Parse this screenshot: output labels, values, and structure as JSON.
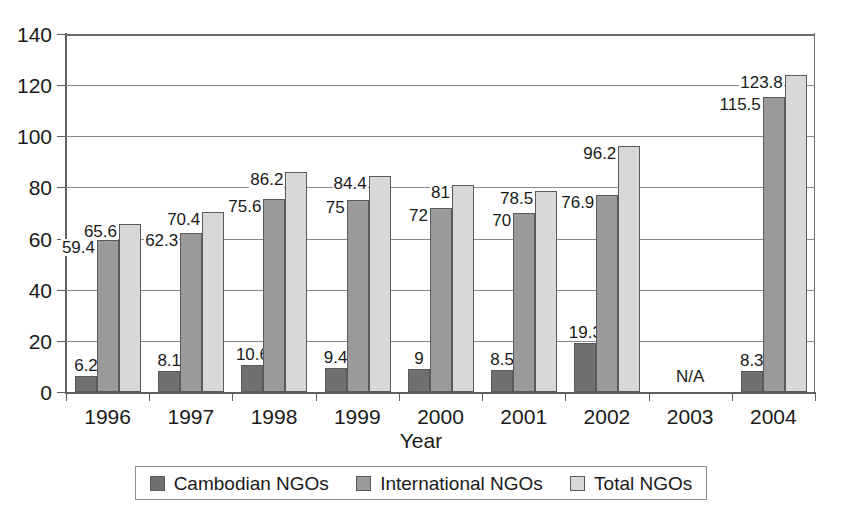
{
  "chart_data": {
    "type": "bar",
    "title": "",
    "xlabel": "Year",
    "ylabel": "",
    "ylim": [
      0,
      140
    ],
    "ytick_step": 20,
    "yticks": [
      "0",
      "20",
      "40",
      "60",
      "80",
      "100",
      "120",
      "140"
    ],
    "grid": true,
    "legend_position": "bottom",
    "categories": [
      "1996",
      "1997",
      "1998",
      "1999",
      "2000",
      "2001",
      "2002",
      "2003",
      "2004"
    ],
    "series": [
      {
        "name": "Cambodian NGOs",
        "color": "#707070",
        "values": [
          6.2,
          8.1,
          10.6,
          9.4,
          9,
          8.5,
          19.3,
          null,
          8.3
        ],
        "labels": [
          "6.2",
          "8.1",
          "10.6",
          "9.4",
          "9",
          "8.5",
          "19.3",
          "",
          "8.3"
        ]
      },
      {
        "name": "International NGOs",
        "color": "#9a9a9a",
        "values": [
          59.4,
          62.3,
          75.6,
          75,
          72,
          70,
          76.9,
          null,
          115.5
        ],
        "labels": [
          "59.4",
          "62.3",
          "75.6",
          "75",
          "72",
          "70",
          "76.9",
          "",
          "115.5"
        ]
      },
      {
        "name": "Total NGOs",
        "color": "#d8d8d8",
        "values": [
          65.6,
          70.4,
          86.2,
          84.4,
          81,
          78.5,
          96.2,
          null,
          123.8
        ],
        "labels": [
          "65.6",
          "70.4",
          "86.2",
          "84.4",
          "81",
          "78.5",
          "96.2",
          "",
          "123.8"
        ]
      }
    ],
    "annotations": [
      {
        "category": "2003",
        "text": "N/A"
      }
    ]
  },
  "legend": {
    "items": [
      {
        "label": "Cambodian NGOs",
        "color": "#707070"
      },
      {
        "label": "International NGOs",
        "color": "#9a9a9a"
      },
      {
        "label": "Total NGOs",
        "color": "#d8d8d8"
      }
    ]
  }
}
